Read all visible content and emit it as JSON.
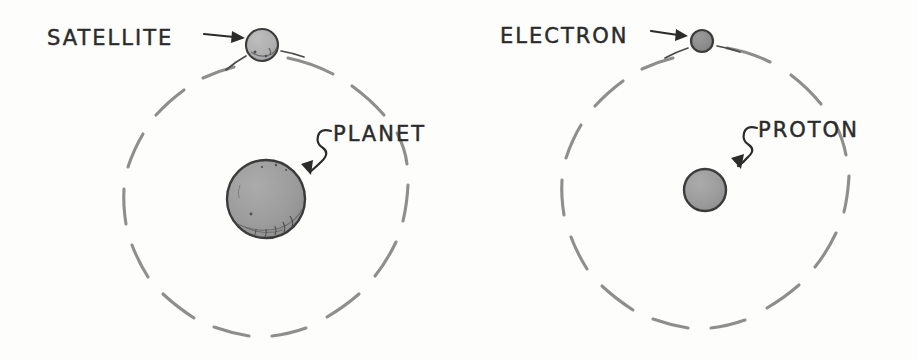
{
  "figure": {
    "background_color": "#fdfdfc",
    "width": 918,
    "height": 361
  },
  "style": {
    "orbit_color": "#8e8e8e",
    "body_fill_large": "#9b9b9b",
    "body_fill_small": "#b0b0b0",
    "body_outline": "#3b3b3b",
    "ink_color": "#2b2b2b"
  },
  "panels": [
    {
      "id": "planetary-system",
      "name": "planetary-system-panel",
      "center_body": {
        "label": "PLANET",
        "name": "planet",
        "cx": 266,
        "cy": 199,
        "r": 39,
        "fill": "#9b9b9b"
      },
      "orbiting_body": {
        "label": "SATELLITE",
        "name": "satellite",
        "cx": 262,
        "cy": 45,
        "r": 16,
        "fill": "#b3b3b3"
      },
      "orbit": {
        "name": "satellite-orbit",
        "cx": 266,
        "cy": 199,
        "r": 142,
        "style": "dashed"
      },
      "labels": [
        {
          "text": "SATELLITE",
          "name": "satellite-label",
          "x": 47,
          "y": 45,
          "anchor": "start"
        },
        {
          "text": "PLANET",
          "name": "planet-label",
          "x": 333,
          "y": 141,
          "anchor": "start"
        }
      ],
      "arrows": [
        {
          "name": "satellite-arrow",
          "kind": "straight",
          "from": [
            204,
            35
          ],
          "to": [
            243,
            38
          ]
        },
        {
          "name": "planet-arrow",
          "kind": "squiggle",
          "from": [
            330,
            133
          ],
          "to": [
            301,
            176
          ]
        }
      ]
    },
    {
      "id": "atom",
      "name": "atom-panel",
      "center_body": {
        "label": "PROTON",
        "name": "proton",
        "cx": 705,
        "cy": 190,
        "r": 21,
        "fill": "#9b9b9b"
      },
      "orbiting_body": {
        "label": "ELECTRON",
        "name": "electron",
        "cx": 702,
        "cy": 41,
        "r": 11,
        "fill": "#8a8a8a"
      },
      "orbit": {
        "name": "electron-orbit",
        "cx": 705,
        "cy": 190,
        "r": 144,
        "style": "dashed"
      },
      "labels": [
        {
          "text": "ELECTRON",
          "name": "electron-label",
          "x": 500,
          "y": 43,
          "anchor": "start"
        },
        {
          "text": "PROTON",
          "name": "proton-label",
          "x": 758,
          "y": 137,
          "anchor": "start"
        }
      ],
      "arrows": [
        {
          "name": "electron-arrow",
          "kind": "straight",
          "from": [
            651,
            32
          ],
          "to": [
            686,
            36
          ]
        },
        {
          "name": "proton-arrow",
          "kind": "squiggle",
          "from": [
            756,
            130
          ],
          "to": [
            731,
            171
          ]
        }
      ]
    }
  ]
}
